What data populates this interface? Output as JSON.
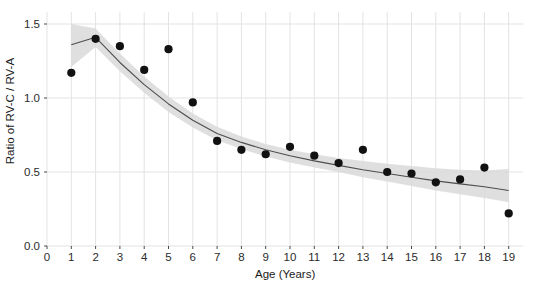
{
  "chart_data": {
    "type": "scatter",
    "title": "",
    "xlabel": "Age (Years)",
    "ylabel": "Ratio of RV-C / RV-A",
    "xlim": [
      0,
      19.6
    ],
    "ylim": [
      0.0,
      1.58
    ],
    "grid": true,
    "legend": null,
    "x_ticks": [
      "0",
      "1",
      "2",
      "3",
      "4",
      "5",
      "6",
      "7",
      "8",
      "9",
      "10",
      "11",
      "12",
      "13",
      "14",
      "15",
      "16",
      "17",
      "18",
      "19"
    ],
    "x_tick_values": [
      0,
      1,
      2,
      3,
      4,
      5,
      6,
      7,
      8,
      9,
      10,
      11,
      12,
      13,
      14,
      15,
      16,
      17,
      18,
      19
    ],
    "y_ticks": [
      "0.0",
      "0.5",
      "1.0",
      "1.5"
    ],
    "y_tick_values": [
      0.0,
      0.5,
      1.0,
      1.5
    ],
    "series": [
      {
        "name": "Observed ratio",
        "type": "scatter",
        "marker": "filled-circle",
        "color": "#111111",
        "x": [
          1,
          2,
          3,
          4,
          5,
          6,
          7,
          8,
          9,
          10,
          11,
          12,
          13,
          14,
          15,
          16,
          17,
          18,
          19
        ],
        "values": [
          1.17,
          1.4,
          1.35,
          1.19,
          1.33,
          0.97,
          0.71,
          0.65,
          0.62,
          0.67,
          0.61,
          0.56,
          0.65,
          0.5,
          0.49,
          0.43,
          0.45,
          0.53,
          0.22
        ]
      },
      {
        "name": "Fitted trend",
        "type": "line",
        "color": "#4d4d4d",
        "x": [
          1,
          2,
          3,
          4,
          5,
          6,
          7,
          8,
          9,
          10,
          11,
          12,
          13,
          14,
          15,
          16,
          17,
          18,
          19
        ],
        "values": [
          1.36,
          1.41,
          1.24,
          1.09,
          0.96,
          0.85,
          0.76,
          0.7,
          0.65,
          0.61,
          0.575,
          0.545,
          0.515,
          0.49,
          0.465,
          0.44,
          0.42,
          0.4,
          0.375
        ]
      },
      {
        "name": "Confidence band",
        "type": "area",
        "color": "#d9d9d9",
        "x": [
          1,
          2,
          3,
          4,
          5,
          6,
          7,
          8,
          9,
          10,
          11,
          12,
          13,
          14,
          15,
          16,
          17,
          18,
          19
        ],
        "upper": [
          1.5,
          1.47,
          1.3,
          1.145,
          1.01,
          0.895,
          0.805,
          0.74,
          0.69,
          0.65,
          0.62,
          0.595,
          0.575,
          0.555,
          0.54,
          0.525,
          0.515,
          0.51,
          0.52
        ],
        "lower": [
          1.21,
          1.345,
          1.18,
          1.035,
          0.905,
          0.8,
          0.715,
          0.655,
          0.605,
          0.565,
          0.53,
          0.5,
          0.465,
          0.435,
          0.405,
          0.375,
          0.35,
          0.325,
          0.295
        ]
      }
    ]
  },
  "axes": {
    "x_title": "Age (Years)",
    "y_title": "Ratio of RV-C / RV-A"
  },
  "style": {
    "panel_background": "#ffffff",
    "grid_color": "#e3e3e3",
    "point_color": "#111111",
    "line_color": "#4d4d4d",
    "band_color": "#d9d9d9",
    "text_color": "#2b2b2b"
  }
}
